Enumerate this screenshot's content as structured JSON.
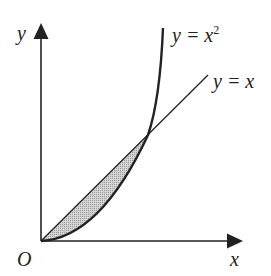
{
  "diagram": {
    "type": "function-graph",
    "axes": {
      "x_label": "x",
      "y_label": "y",
      "origin_label": "O"
    },
    "curves": [
      {
        "name": "parabola",
        "label_lhs": "y = x",
        "label_sup": "2",
        "equation": "y = x^2"
      },
      {
        "name": "line",
        "label": "y = x",
        "equation": "y = x"
      }
    ],
    "shaded_region": {
      "description": "region between y = x and y = x^2 from x = 0 to x = 1",
      "fill": "#c8c8c8"
    },
    "colors": {
      "stroke": "#222222",
      "background": "#ffffff",
      "shade": "#c8c8c8"
    }
  }
}
